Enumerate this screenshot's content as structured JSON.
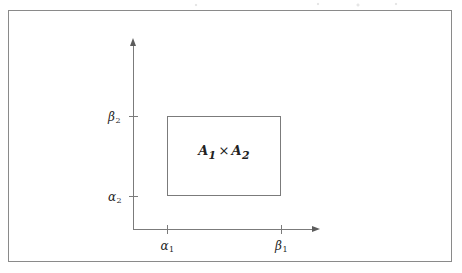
{
  "figure": {
    "kind": "math-diagram",
    "frame": {
      "visible": true,
      "color": "#8a8a8a"
    },
    "axes": {
      "x_axis_name": "horizontal-axis",
      "y_axis_name": "vertical-axis",
      "line_color": "#7b7b7b",
      "arrow_color": "#5c5c5c"
    },
    "rectangle": {
      "label_main": "A",
      "label_main_sub": "1",
      "times_symbol": "×",
      "label_second": "A",
      "label_second_sub": "2",
      "border_color": "#7b7b7b"
    },
    "ticks": {
      "x": [
        {
          "name": "alpha1",
          "symbol": "α",
          "subscript": "1"
        },
        {
          "name": "beta1",
          "symbol": "β",
          "subscript": "1"
        }
      ],
      "y": [
        {
          "name": "beta2",
          "symbol": "β",
          "subscript": "2"
        },
        {
          "name": "alpha2",
          "symbol": "α",
          "subscript": "2"
        }
      ]
    }
  },
  "chart_data": {
    "type": "scatter",
    "title": "",
    "xlabel": "",
    "ylabel": "",
    "grid": false,
    "legend": null,
    "xticks": [
      "α₁",
      "β₁"
    ],
    "yticks": [
      "α₂",
      "β₂"
    ],
    "annotations": [
      "A₁ × A₂"
    ],
    "shapes": [
      {
        "type": "rect",
        "label": "A₁ × A₂",
        "x0_tick": "α₁",
        "x1_tick": "β₁",
        "y0_tick": "α₂",
        "y1_tick": "β₂",
        "filled": false
      }
    ]
  }
}
